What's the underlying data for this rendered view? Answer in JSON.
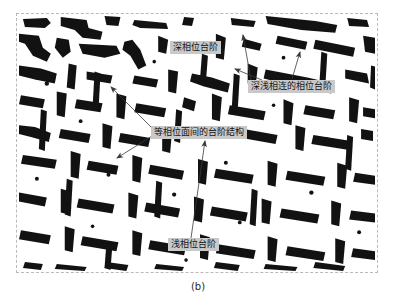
{
  "figure": {
    "caption": "(b)",
    "panel": {
      "border_style": "dashed",
      "border_color": "#b9b9b9",
      "background_color": "#ffffff",
      "foreground_color": "#111111",
      "description": "binary black-and-white micrograph of phase-step microstructure"
    },
    "label_style": {
      "background_color": "#c9c9c9",
      "text_color": "#131313"
    },
    "annotations": [
      {
        "id": "deep",
        "text": "深相位台阶",
        "x": 170,
        "y": 41
      },
      {
        "id": "linked",
        "text": "深浅相连的相位台阶",
        "x": 248,
        "y": 80
      },
      {
        "id": "interplanar",
        "text": "等相位面间的台阶结构",
        "x": 151,
        "y": 126
      },
      {
        "id": "shallow",
        "text": "浅相位台阶",
        "x": 168,
        "y": 238
      }
    ]
  }
}
